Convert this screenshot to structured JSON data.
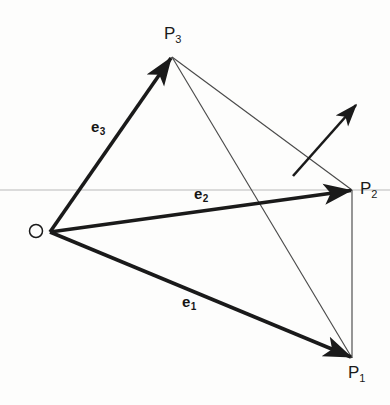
{
  "figure": {
    "kind": "vector-diagram",
    "background_color": "#fdfdfc",
    "width": 390,
    "height": 405
  },
  "labels": {
    "origin": "O",
    "e1": "e",
    "e1_sub": "1",
    "e2": "e",
    "e2_sub": "2",
    "e3": "e",
    "e3_sub": "3",
    "p1": "P",
    "p1_sub": "1",
    "p2": "P",
    "p2_sub": "2",
    "p3": "P",
    "p3_sub": "3"
  },
  "colors": {
    "vector_stroke": "#1a1a1a",
    "edge_stroke": "#4a4a4a",
    "axis_stroke": "#b9b9b9",
    "text": "#1a1a1a"
  },
  "geometry": {
    "origin_point": {
      "x": 50,
      "y": 232
    },
    "origin_circle": {
      "cx": 36,
      "cy": 231,
      "r": 6.5
    },
    "p1_point": {
      "x": 352,
      "y": 358
    },
    "p2_point": {
      "x": 352,
      "y": 190
    },
    "p3_point": {
      "x": 172,
      "y": 57
    },
    "horizontal_axis": {
      "x1": 0,
      "y1": 190,
      "x2": 390,
      "y2": 190
    },
    "free_arrow": {
      "x1": 293,
      "y1": 176,
      "x2": 357,
      "y2": 104
    },
    "vectors": [
      {
        "name": "e1",
        "from": "origin",
        "to": "p1",
        "width": 4
      },
      {
        "name": "e2",
        "from": "origin",
        "to": "p2",
        "width": 4
      },
      {
        "name": "e3",
        "from": "origin",
        "to": "p3",
        "width": 4
      }
    ],
    "edges": [
      {
        "name": "p3-p2",
        "x1": 172,
        "y1": 57,
        "x2": 352,
        "y2": 190
      },
      {
        "name": "p3-p1",
        "x1": 172,
        "y1": 57,
        "x2": 352,
        "y2": 358
      },
      {
        "name": "p2-p1",
        "x1": 352,
        "y1": 190,
        "x2": 352,
        "y2": 358
      }
    ],
    "label_positions": {
      "origin": {
        "left": 27,
        "top": 221
      },
      "e1": {
        "left": 182,
        "top": 294
      },
      "e2": {
        "left": 194,
        "top": 182
      },
      "e3": {
        "left": 91,
        "top": 119
      },
      "p1": {
        "left": 348,
        "top": 364
      },
      "p2": {
        "left": 360,
        "top": 180
      },
      "p3": {
        "left": 164,
        "top": 25
      }
    }
  }
}
